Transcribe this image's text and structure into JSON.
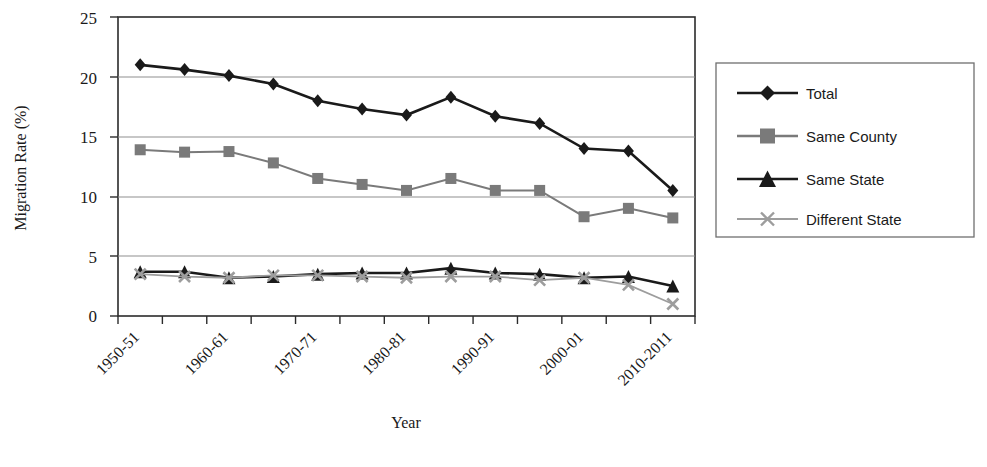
{
  "chart_data": {
    "type": "line",
    "title": "",
    "xlabel": "Year",
    "ylabel": "Migration Rate (%)",
    "ylim": [
      0,
      25
    ],
    "yticks": [
      0,
      5,
      10,
      15,
      20,
      25
    ],
    "ytick_labels": [
      "0",
      "5",
      "10",
      "15",
      "20",
      "25"
    ],
    "grid": true,
    "grid_axis": "y",
    "legend_position": "right-outside",
    "x": [
      "1950-51",
      "1955-56",
      "1960-61",
      "1965-66",
      "1970-71",
      "1975-76",
      "1980-81",
      "1985-86",
      "1990-91",
      "1995-96",
      "2000-01",
      "2005-06",
      "2010-2011"
    ],
    "xtick_labels_shown": [
      "1950-51",
      "1960-61",
      "1970-71",
      "1980-81",
      "1990-91",
      "2000-01",
      "2010-2011"
    ],
    "xtick_label_indices": [
      0,
      2,
      4,
      6,
      8,
      10,
      12
    ],
    "series": [
      {
        "name": "Total",
        "marker": "diamond",
        "color": "#1a1a1a",
        "values": [
          21.0,
          20.6,
          20.1,
          19.4,
          18.0,
          17.3,
          16.8,
          18.3,
          16.7,
          16.1,
          14.0,
          13.8,
          10.5
        ]
      },
      {
        "name": "Same County",
        "marker": "square",
        "color": "#7a7a7a",
        "values": [
          13.9,
          13.7,
          13.75,
          12.8,
          11.5,
          11.0,
          10.5,
          11.5,
          10.5,
          10.5,
          8.3,
          9.0,
          8.2
        ]
      },
      {
        "name": "Same State",
        "marker": "triangle",
        "color": "#1a1a1a",
        "values": [
          3.7,
          3.7,
          3.2,
          3.3,
          3.5,
          3.6,
          3.6,
          4.0,
          3.6,
          3.5,
          3.2,
          3.3,
          2.5
        ]
      },
      {
        "name": "Different State",
        "marker": "cross",
        "color": "#9d9d9d",
        "values": [
          3.5,
          3.3,
          3.2,
          3.4,
          3.4,
          3.3,
          3.2,
          3.3,
          3.3,
          3.0,
          3.2,
          2.6,
          1.0
        ]
      }
    ]
  },
  "axes": {
    "y_title": "Migration Rate (%)",
    "x_title": "Year"
  },
  "legend": {
    "items": [
      {
        "label": "Total",
        "marker": "diamond",
        "color": "#1a1a1a"
      },
      {
        "label": "Same County",
        "marker": "square",
        "color": "#7a7a7a"
      },
      {
        "label": "Same State",
        "marker": "triangle",
        "color": "#1a1a1a"
      },
      {
        "label": "Different State",
        "marker": "cross",
        "color": "#9d9d9d"
      }
    ]
  },
  "colors": {
    "total": "#1a1a1a",
    "same_county": "#7a7a7a",
    "same_state": "#1a1a1a",
    "different_state": "#9d9d9d",
    "gridline": "#8f8f8f",
    "axis": "#2b2b2b",
    "background": "#ffffff"
  }
}
